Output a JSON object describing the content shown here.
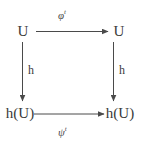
{
  "diagram": {
    "type": "commutative-square",
    "nodes": {
      "top_left": "U",
      "top_right": "U",
      "bottom_left": "h(U)",
      "bottom_right": "h(U)"
    },
    "edges": {
      "top": {
        "base": "φ",
        "superscript": "t",
        "direction": "left-to-right"
      },
      "bottom": {
        "base": "ψ",
        "superscript": "t",
        "direction": "left-to-right"
      },
      "left": {
        "label": "h",
        "direction": "top-to-bottom"
      },
      "right": {
        "label": "h",
        "direction": "top-to-bottom"
      }
    }
  },
  "colors": {
    "background": "#ffffff",
    "line": "#4a4a4a",
    "text": "#3a3a3a"
  }
}
